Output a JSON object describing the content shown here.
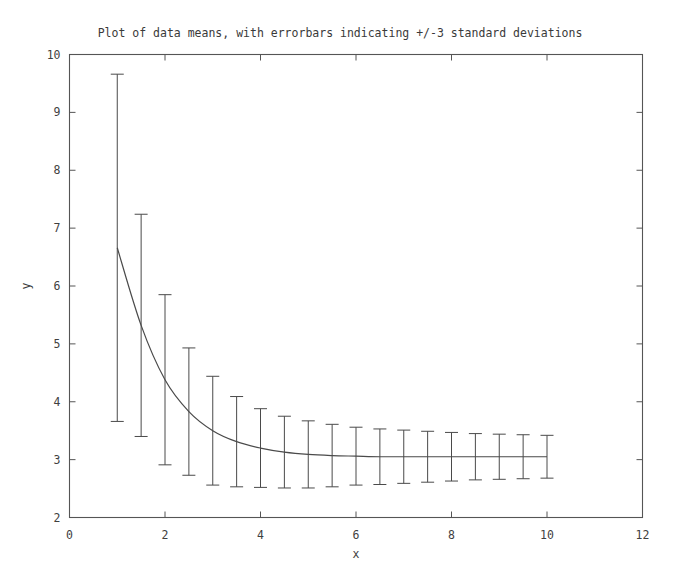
{
  "chart_data": {
    "type": "line",
    "title": "Plot of data means, with errorbars indicating +/-3 standard deviations",
    "xlabel": "x",
    "ylabel": "y",
    "xlim": [
      0,
      12
    ],
    "ylim": [
      2,
      10
    ],
    "xticks": [
      0,
      2,
      4,
      6,
      8,
      10,
      12
    ],
    "xtick_labels": [
      "0",
      "2",
      "4",
      "6",
      "8",
      "10",
      "12"
    ],
    "yticks": [
      2,
      3,
      4,
      5,
      6,
      7,
      8,
      9,
      10
    ],
    "ytick_labels": [
      "2",
      "3",
      "4",
      "5",
      "6",
      "7",
      "8",
      "9",
      "10"
    ],
    "grid": false,
    "legend": null,
    "line_color": "#4a4a4a",
    "errorbar_color": "#4a4a4a",
    "errorbar_label": "+/-3 standard deviations",
    "x": [
      1.0,
      1.5,
      2.0,
      2.5,
      3.0,
      3.5,
      4.0,
      4.5,
      5.0,
      5.5,
      6.0,
      6.5,
      7.0,
      7.5,
      8.0,
      8.5,
      9.0,
      9.5,
      10.0
    ],
    "y": [
      6.66,
      5.32,
      4.38,
      3.83,
      3.5,
      3.31,
      3.2,
      3.13,
      3.09,
      3.07,
      3.06,
      3.05,
      3.05,
      3.05,
      3.05,
      3.05,
      3.05,
      3.05,
      3.05
    ],
    "yerr": [
      3.0,
      1.92,
      1.47,
      1.1,
      0.94,
      0.78,
      0.68,
      0.62,
      0.58,
      0.54,
      0.5,
      0.48,
      0.46,
      0.44,
      0.42,
      0.4,
      0.39,
      0.38,
      0.37
    ],
    "upper": [
      9.66,
      7.24,
      5.85,
      4.93,
      4.44,
      4.09,
      3.88,
      3.75,
      3.67,
      3.61,
      3.56,
      3.53,
      3.51,
      3.49,
      3.47,
      3.45,
      3.44,
      3.43,
      3.42
    ],
    "lower": [
      3.66,
      3.4,
      2.91,
      2.73,
      2.56,
      2.53,
      2.52,
      2.51,
      2.51,
      2.53,
      2.56,
      2.57,
      2.59,
      2.61,
      2.63,
      2.65,
      2.66,
      2.67,
      2.68
    ],
    "curve_x_start": 1.0,
    "curve_x_end": 10.0
  }
}
